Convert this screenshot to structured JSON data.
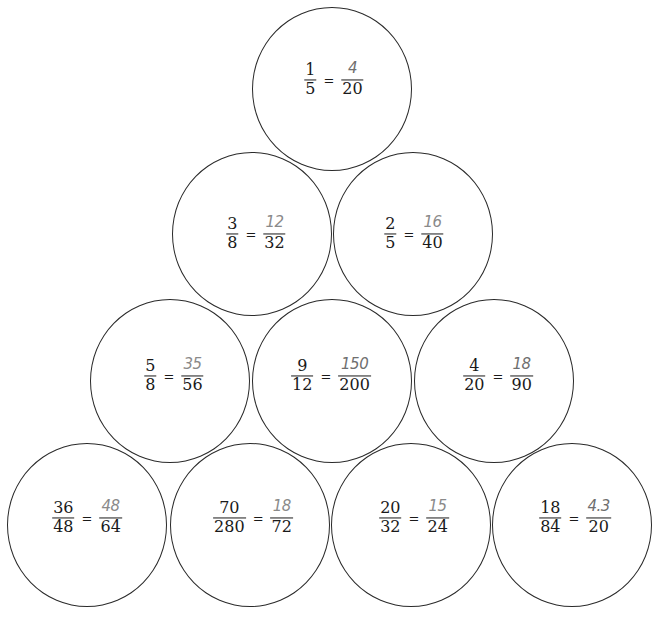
{
  "worksheet": {
    "title": "",
    "ink_colors": {
      "printed": "#1a1a1a",
      "handwritten": "#8a8a8a",
      "circle_stroke": "#2a2a2a"
    },
    "rows": [
      {
        "row": 1,
        "circles": [
          {
            "left": {
              "num": "1",
              "den": "5"
            },
            "equals": "=",
            "right": {
              "num": "4",
              "den": "20"
            },
            "cx": 332,
            "cy": 89
          }
        ]
      },
      {
        "row": 2,
        "circles": [
          {
            "left": {
              "num": "3",
              "den": "8"
            },
            "equals": "=",
            "right": {
              "num": "12",
              "den": "32"
            },
            "cx": 252,
            "cy": 234
          },
          {
            "left": {
              "num": "2",
              "den": "5"
            },
            "equals": "=",
            "right": {
              "num": "16",
              "den": "40"
            },
            "cx": 413,
            "cy": 234
          }
        ]
      },
      {
        "row": 3,
        "circles": [
          {
            "left": {
              "num": "5",
              "den": "8"
            },
            "equals": "=",
            "right": {
              "num": "35",
              "den": "56"
            },
            "cx": 170,
            "cy": 381
          },
          {
            "left": {
              "num": "9",
              "den": "12"
            },
            "equals": "=",
            "right": {
              "num": "150",
              "den": "200"
            },
            "cx": 332,
            "cy": 381
          },
          {
            "left": {
              "num": "4",
              "den": "20"
            },
            "equals": "=",
            "right": {
              "num": "18",
              "den": "90"
            },
            "cx": 494,
            "cy": 381
          }
        ]
      },
      {
        "row": 4,
        "circles": [
          {
            "left": {
              "num": "36",
              "den": "48"
            },
            "equals": "=",
            "right": {
              "num": "48",
              "den": "64"
            },
            "cx": 88,
            "cy": 526
          },
          {
            "left": {
              "num": "70",
              "den": "280"
            },
            "equals": "=",
            "right": {
              "num": "18",
              "den": "72"
            },
            "cx": 250,
            "cy": 526
          },
          {
            "left": {
              "num": "20",
              "den": "32"
            },
            "equals": "=",
            "right": {
              "num": "15",
              "den": "24"
            },
            "cx": 411,
            "cy": 526
          },
          {
            "left": {
              "num": "18",
              "den": "84"
            },
            "equals": "=",
            "right": {
              "num": "4.3",
              "den": "20"
            },
            "cx": 573,
            "cy": 526
          }
        ]
      }
    ]
  }
}
